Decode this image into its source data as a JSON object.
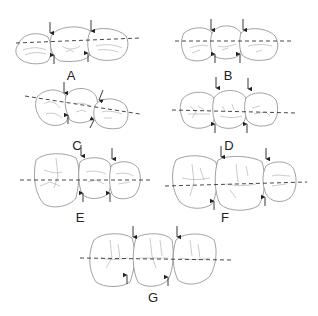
{
  "figure": {
    "panels": [
      {
        "id": "A",
        "label": "A"
      },
      {
        "id": "B",
        "label": "B"
      },
      {
        "id": "C",
        "label": "C"
      },
      {
        "id": "D",
        "label": "D"
      },
      {
        "id": "E",
        "label": "E"
      },
      {
        "id": "F",
        "label": "F"
      },
      {
        "id": "G",
        "label": "G"
      }
    ],
    "colors": {
      "outline": "#8a8a8a",
      "axis": "#333333",
      "arrow": "#222222",
      "background": "#ffffff"
    }
  }
}
